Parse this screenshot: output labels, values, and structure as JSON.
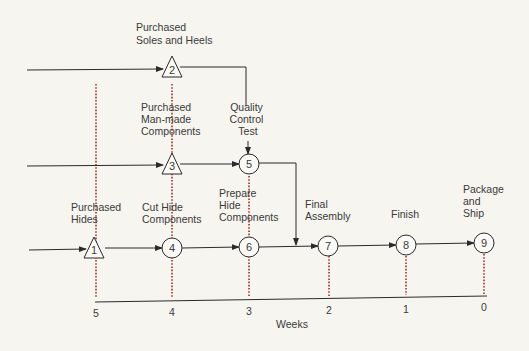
{
  "colors": {
    "background": "#f7f5f0",
    "line": "#2b2b2b",
    "dotted_leader": "#a0332a",
    "text": "#3a3a3a"
  },
  "nodes": [
    {
      "id": "1",
      "shape": "triangle",
      "label_lines": [
        "Purchased",
        "Hides"
      ]
    },
    {
      "id": "2",
      "shape": "triangle",
      "label_lines": [
        "Purchased",
        "Soles and Heels"
      ]
    },
    {
      "id": "3",
      "shape": "triangle",
      "label_lines": [
        "Purchased",
        "Man-made",
        "Components"
      ]
    },
    {
      "id": "4",
      "shape": "circle",
      "label_lines": [
        "Cut Hide",
        "Components"
      ]
    },
    {
      "id": "5",
      "shape": "circle",
      "label_lines": [
        "Quality",
        "Control",
        "Test"
      ]
    },
    {
      "id": "6",
      "shape": "circle",
      "label_lines": [
        "Prepare",
        "Hide",
        "Components"
      ]
    },
    {
      "id": "7",
      "shape": "circle",
      "label_lines": [
        "Final",
        "Assembly"
      ]
    },
    {
      "id": "8",
      "shape": "circle",
      "label_lines": [
        "Finish"
      ]
    },
    {
      "id": "9",
      "shape": "circle",
      "label_lines": [
        "Package",
        "and",
        "Ship"
      ]
    }
  ],
  "edges": [
    [
      "start-top",
      "2"
    ],
    [
      "2",
      "5"
    ],
    [
      "start-mid",
      "3"
    ],
    [
      "3",
      "5"
    ],
    [
      "5",
      "7"
    ],
    [
      "start-bottom",
      "1"
    ],
    [
      "1",
      "4"
    ],
    [
      "4",
      "6"
    ],
    [
      "6",
      "7"
    ],
    [
      "7",
      "8"
    ],
    [
      "8",
      "9"
    ]
  ],
  "axis": {
    "title": "Weeks",
    "ticks": [
      "5",
      "4",
      "3",
      "2",
      "1",
      "0"
    ]
  }
}
